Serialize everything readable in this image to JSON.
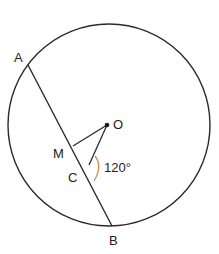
{
  "diagram": {
    "type": "circle-geometry",
    "colors": {
      "stroke": "#2a2a2a",
      "angle_arc": "#d9864a",
      "text": "#222222",
      "background": "#ffffff"
    },
    "circle": {
      "center_label": "O",
      "cx": 109,
      "cy": 125,
      "r": 101
    },
    "points": {
      "A": {
        "label": "A",
        "x": 28,
        "y": 65
      },
      "B": {
        "label": "B",
        "x": 112,
        "y": 226
      },
      "O": {
        "label": "O",
        "x": 107,
        "y": 125
      },
      "M": {
        "label": "M",
        "x": 73,
        "y": 146
      },
      "C": {
        "label": "C",
        "x": 89,
        "y": 165
      }
    },
    "segments": [
      "AB",
      "OM",
      "OC"
    ],
    "angle": {
      "vertex": "C",
      "between": [
        "CO",
        "CB"
      ],
      "label": "120°"
    }
  }
}
